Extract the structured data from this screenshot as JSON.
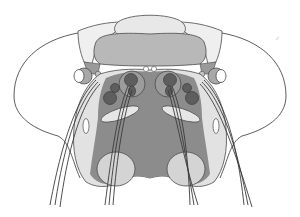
{
  "diagram": {
    "labels": [],
    "colors": {
      "background": "#ffffff",
      "outline": "#3a3a3a",
      "light_region": "#e6e6e6",
      "mid_region": "#b4b4b4",
      "dark_region": "#8a8a8a",
      "neuropil_dark": "#5e5e5e",
      "lobe_light": "#d2d2d2"
    },
    "regions": [
      "head-capsule-outline",
      "optic-lobe-left",
      "optic-lobe-right",
      "protocerebrum-upper",
      "protocerebrum-central",
      "ocellus-left",
      "ocellus-right",
      "deutocerebrum",
      "antennal-lobe-left",
      "antennal-lobe-right",
      "glomeruli-left",
      "glomeruli-right",
      "ventral-lobe-left",
      "ventral-lobe-right",
      "nerve-tracts-left",
      "nerve-tracts-right"
    ]
  }
}
